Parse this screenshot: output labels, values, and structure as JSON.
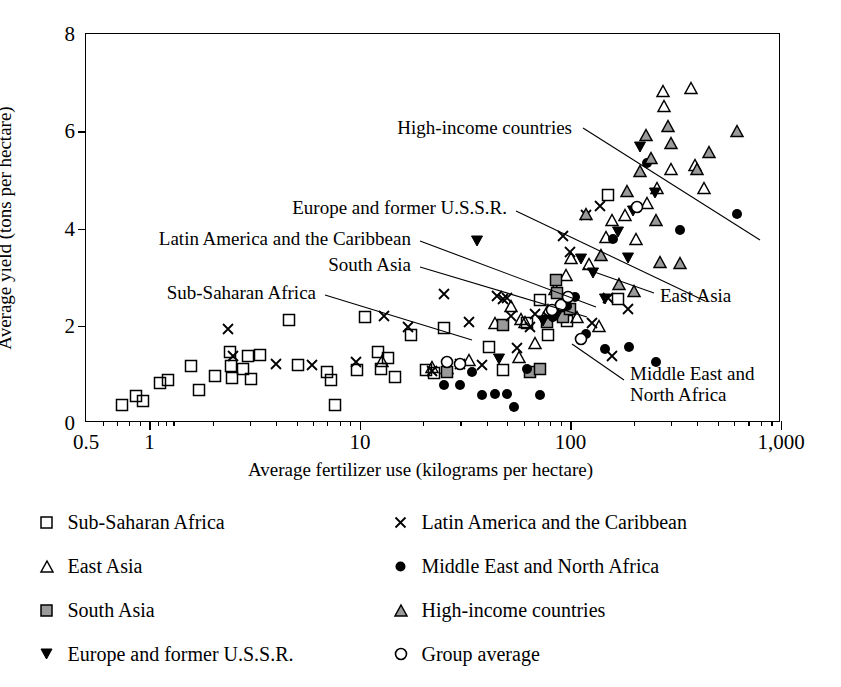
{
  "chart_data": {
    "type": "scatter",
    "title": "",
    "xlabel": "Average fertilizer use (kilograms per hectare)",
    "ylabel": "Average yield (tons per hectare)",
    "xscale": "log",
    "xlim": [
      0.5,
      1000
    ],
    "ylim": [
      0,
      8
    ],
    "xticks": [
      "0.5",
      "1",
      "10",
      "100",
      "1,000"
    ],
    "xtick_values": [
      0.5,
      1,
      10,
      100,
      1000
    ],
    "yticks": [
      "0",
      "2",
      "4",
      "6",
      "8"
    ],
    "ytick_values": [
      0,
      2,
      4,
      6,
      8
    ],
    "grid": false,
    "legend_position": "below",
    "series": [
      {
        "name": "Sub-Saharan Africa",
        "marker": "open-square",
        "color": "#000000",
        "fill": "none",
        "points": [
          [
            0.74,
            0.37
          ],
          [
            0.86,
            0.55
          ],
          [
            0.93,
            0.46
          ],
          [
            1.12,
            0.83
          ],
          [
            1.22,
            0.89
          ],
          [
            1.58,
            1.18
          ],
          [
            1.72,
            0.68
          ],
          [
            2.05,
            0.96
          ],
          [
            2.42,
            1.45
          ],
          [
            2.45,
            1.18
          ],
          [
            2.47,
            0.93
          ],
          [
            2.78,
            1.11
          ],
          [
            2.95,
            1.38
          ],
          [
            3.05,
            0.91
          ],
          [
            3.35,
            1.4
          ],
          [
            4.6,
            2.12
          ],
          [
            5.1,
            1.2
          ],
          [
            7.0,
            1.04
          ],
          [
            7.3,
            0.89
          ],
          [
            7.6,
            0.36
          ],
          [
            9.7,
            1.09
          ],
          [
            10.6,
            2.18
          ],
          [
            12.2,
            1.47
          ],
          [
            12.6,
            1.12
          ],
          [
            13.6,
            1.34
          ],
          [
            14.6,
            0.95
          ],
          [
            17.5,
            1.82
          ],
          [
            20.5,
            1.1
          ],
          [
            22.5,
            1.03
          ],
          [
            25.0,
            1.95
          ],
          [
            41.0,
            1.56
          ],
          [
            48.0,
            1.08
          ],
          [
            62.0,
            2.05
          ],
          [
            72.0,
            2.52
          ],
          [
            78.0,
            1.82
          ],
          [
            96.0,
            2.1
          ],
          [
            150.0,
            4.68
          ],
          [
            168.0,
            2.56
          ]
        ]
      },
      {
        "name": "East Asia",
        "marker": "open-triangle-up",
        "color": "#000000",
        "fill": "none",
        "points": [
          [
            12.8,
            1.28
          ],
          [
            22.0,
            1.16
          ],
          [
            26.0,
            1.13
          ],
          [
            33.0,
            1.3
          ],
          [
            44.0,
            2.05
          ],
          [
            52.0,
            2.41
          ],
          [
            57.0,
            1.36
          ],
          [
            58.0,
            2.14
          ],
          [
            61.0,
            2.08
          ],
          [
            68.0,
            1.65
          ],
          [
            78.0,
            2.32
          ],
          [
            84.0,
            2.75
          ],
          [
            95.0,
            3.05
          ],
          [
            101.0,
            3.4
          ],
          [
            108.0,
            2.18
          ],
          [
            122.0,
            3.27
          ],
          [
            136.0,
            2.0
          ],
          [
            148.0,
            3.82
          ],
          [
            158.0,
            4.18
          ],
          [
            182.0,
            4.28
          ],
          [
            205.0,
            3.78
          ],
          [
            232.0,
            4.52
          ],
          [
            258.0,
            4.84
          ],
          [
            276.0,
            6.82
          ],
          [
            278.0,
            6.52
          ],
          [
            300.0,
            5.22
          ],
          [
            372.0,
            6.88
          ],
          [
            390.0,
            5.3
          ],
          [
            430.0,
            4.84
          ]
        ]
      },
      {
        "name": "South Asia",
        "marker": "filled-gray-square",
        "color": "#000000",
        "fill": "#9a9a9a",
        "points": [
          [
            26.0,
            1.04
          ],
          [
            48.0,
            2.02
          ],
          [
            64.0,
            1.05
          ],
          [
            72.0,
            1.12
          ],
          [
            77.0,
            2.08
          ],
          [
            85.0,
            2.95
          ],
          [
            86.0,
            2.68
          ],
          [
            92.0,
            2.18
          ],
          [
            100.0,
            2.34
          ]
        ]
      },
      {
        "name": "Europe and former U.S.S.R.",
        "marker": "filled-triangle-down",
        "color": "#000000",
        "fill": "#000000",
        "points": [
          [
            36.0,
            3.74
          ],
          [
            46.0,
            1.32
          ],
          [
            74.0,
            2.1
          ],
          [
            86.0,
            2.22
          ],
          [
            112.0,
            3.38
          ],
          [
            128.0,
            3.08
          ],
          [
            146.0,
            2.56
          ],
          [
            168.0,
            3.92
          ],
          [
            188.0,
            3.4
          ],
          [
            198.0,
            4.36
          ],
          [
            215.0,
            5.68
          ],
          [
            252.0,
            4.72
          ]
        ]
      },
      {
        "name": "Latin America and the Caribbean",
        "marker": "cross-x",
        "color": "#000000",
        "fill": "none",
        "points": [
          [
            2.35,
            1.93
          ],
          [
            2.5,
            1.38
          ],
          [
            4.0,
            1.22
          ],
          [
            5.9,
            1.19
          ],
          [
            9.6,
            1.26
          ],
          [
            13.0,
            2.2
          ],
          [
            17.0,
            1.97
          ],
          [
            22.0,
            1.07
          ],
          [
            25.0,
            2.65
          ],
          [
            30.0,
            1.22
          ],
          [
            33.0,
            2.08
          ],
          [
            38.0,
            1.2
          ],
          [
            45.0,
            2.62
          ],
          [
            48.0,
            2.54
          ],
          [
            50.0,
            2.58
          ],
          [
            52.0,
            2.2
          ],
          [
            56.0,
            1.55
          ],
          [
            64.0,
            1.98
          ],
          [
            68.0,
            2.24
          ],
          [
            78.0,
            2.19
          ],
          [
            92.0,
            3.84
          ],
          [
            100.0,
            3.52
          ],
          [
            118.0,
            4.28
          ],
          [
            127.0,
            2.05
          ],
          [
            138.0,
            4.46
          ],
          [
            150.0,
            2.58
          ],
          [
            158.0,
            1.38
          ],
          [
            188.0,
            2.35
          ]
        ]
      },
      {
        "name": "Middle East and North Africa",
        "marker": "filled-circle",
        "color": "#000000",
        "fill": "#000000",
        "points": [
          [
            25.0,
            0.79
          ],
          [
            30.0,
            0.78
          ],
          [
            34.0,
            1.05
          ],
          [
            38.0,
            0.58
          ],
          [
            44.0,
            0.6
          ],
          [
            50.0,
            0.6
          ],
          [
            54.0,
            0.33
          ],
          [
            62.0,
            1.12
          ],
          [
            72.0,
            0.58
          ],
          [
            83.0,
            2.17
          ],
          [
            96.0,
            2.4
          ],
          [
            105.0,
            2.6
          ],
          [
            118.0,
            1.84
          ],
          [
            146.0,
            1.52
          ],
          [
            160.0,
            3.78
          ],
          [
            190.0,
            1.56
          ],
          [
            230.0,
            5.35
          ],
          [
            255.0,
            1.26
          ],
          [
            330.0,
            3.96
          ],
          [
            620.0,
            4.3
          ]
        ]
      },
      {
        "name": "High-income countries",
        "marker": "filled-gray-triangle-up",
        "color": "#000000",
        "fill": "#9a9a9a",
        "points": [
          [
            118.0,
            4.3
          ],
          [
            140.0,
            3.46
          ],
          [
            170.0,
            2.85
          ],
          [
            186.0,
            4.78
          ],
          [
            200.0,
            2.72
          ],
          [
            215.0,
            5.18
          ],
          [
            228.0,
            5.92
          ],
          [
            240.0,
            5.46
          ],
          [
            255.0,
            4.18
          ],
          [
            265.0,
            3.32
          ],
          [
            290.0,
            6.1
          ],
          [
            300.0,
            5.76
          ],
          [
            330.0,
            3.3
          ],
          [
            398.0,
            5.22
          ],
          [
            455.0,
            5.58
          ],
          [
            620.0,
            6.0
          ]
        ]
      },
      {
        "name": "Group average",
        "marker": "open-circle",
        "color": "#000000",
        "fill": "none",
        "points": [
          [
            26.0,
            1.25
          ],
          [
            30.0,
            1.22
          ],
          [
            82.0,
            2.32
          ],
          [
            90.0,
            2.42
          ],
          [
            97.0,
            2.6
          ],
          [
            112.0,
            1.72
          ],
          [
            208.0,
            4.44
          ]
        ]
      }
    ],
    "annotations": [
      {
        "id": "high-income",
        "text": "High-income countries",
        "align": "right",
        "label_x": 572,
        "label_y": 128,
        "leader": [
          [
            583,
            128
          ],
          [
            760,
            240
          ]
        ]
      },
      {
        "id": "europe-ussr",
        "text": "Europe and former U.S.S.R.",
        "align": "right",
        "label_x": 507,
        "label_y": 208,
        "leader": [
          [
            516,
            211
          ],
          [
            705,
            301
          ]
        ]
      },
      {
        "id": "latin-america",
        "text": "Latin America and the Caribbean",
        "align": "right",
        "label_x": 411,
        "label_y": 239,
        "leader": [
          [
            420,
            241
          ],
          [
            596,
            307
          ]
        ]
      },
      {
        "id": "south-asia",
        "text": "South Asia",
        "align": "right",
        "label_x": 411,
        "label_y": 265,
        "leader": [
          [
            420,
            267
          ],
          [
            587,
            317
          ]
        ]
      },
      {
        "id": "sub-saharan",
        "text": "Sub-Saharan Africa",
        "align": "right",
        "label_x": 316,
        "label_y": 293,
        "leader": [
          [
            325,
            295
          ],
          [
            472,
            340
          ]
        ]
      },
      {
        "id": "east-asia",
        "text": "East Asia",
        "align": "left",
        "label_x": 660,
        "label_y": 296,
        "leader": [
          [
            654,
            293
          ],
          [
            583,
            268
          ]
        ]
      },
      {
        "id": "middle-east",
        "text": "Middle East and\nNorth Africa",
        "align": "left",
        "label_x": 630,
        "label_y": 385,
        "leader": [
          [
            624,
            380
          ],
          [
            572,
            344
          ]
        ]
      }
    ]
  },
  "legend": {
    "items": [
      {
        "label": "Sub-Saharan Africa",
        "marker": "open-square"
      },
      {
        "label": "Latin America and the Caribbean",
        "marker": "cross-x"
      },
      {
        "label": "East Asia",
        "marker": "open-triangle-up"
      },
      {
        "label": "Middle East and North Africa",
        "marker": "filled-circle"
      },
      {
        "label": "South Asia",
        "marker": "filled-gray-square"
      },
      {
        "label": "High-income countries",
        "marker": "filled-gray-triangle-up"
      },
      {
        "label": "Europe and former U.S.S.R.",
        "marker": "filled-triangle-down"
      },
      {
        "label": "Group average",
        "marker": "open-circle"
      }
    ]
  },
  "colors": {
    "axis": "#000000",
    "gray_fill": "#9a9a9a",
    "background": "#ffffff"
  }
}
